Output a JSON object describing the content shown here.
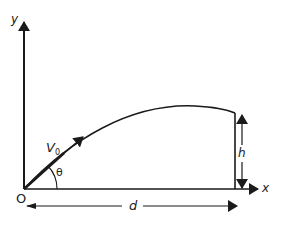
{
  "diagram": {
    "labels": {
      "y_axis": "y",
      "x_axis": "x",
      "origin": "O",
      "velocity": "V",
      "velocity_sub": "0",
      "angle": "θ",
      "height": "h",
      "distance": "d"
    },
    "colors": {
      "stroke": "#1a1a1a",
      "background": "#ffffff"
    }
  }
}
